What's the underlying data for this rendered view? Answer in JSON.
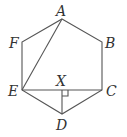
{
  "diagram": {
    "type": "geometry",
    "points": [
      {
        "id": "A",
        "label": "A",
        "x": 62,
        "y": 19,
        "lx": 56,
        "ly": 16
      },
      {
        "id": "B",
        "label": "B",
        "x": 102,
        "y": 42,
        "lx": 105,
        "ly": 48
      },
      {
        "id": "C",
        "label": "C",
        "x": 102,
        "y": 90,
        "lx": 106,
        "ly": 96
      },
      {
        "id": "D",
        "label": "D",
        "x": 62,
        "y": 114,
        "lx": 56,
        "ly": 130
      },
      {
        "id": "E",
        "label": "E",
        "x": 22,
        "y": 90,
        "lx": 8,
        "ly": 96
      },
      {
        "id": "F",
        "label": "F",
        "x": 22,
        "y": 42,
        "lx": 9,
        "ly": 48
      },
      {
        "id": "X",
        "label": "X",
        "x": 62,
        "y": 90,
        "lx": 56,
        "ly": 86
      }
    ],
    "segments": [
      [
        "A",
        "B"
      ],
      [
        "B",
        "C"
      ],
      [
        "C",
        "D"
      ],
      [
        "D",
        "E"
      ],
      [
        "E",
        "F"
      ],
      [
        "F",
        "A"
      ],
      [
        "A",
        "E"
      ],
      [
        "E",
        "C"
      ],
      [
        "D",
        "X"
      ]
    ],
    "right_angle_marker": {
      "at": "X",
      "size": 6
    }
  }
}
